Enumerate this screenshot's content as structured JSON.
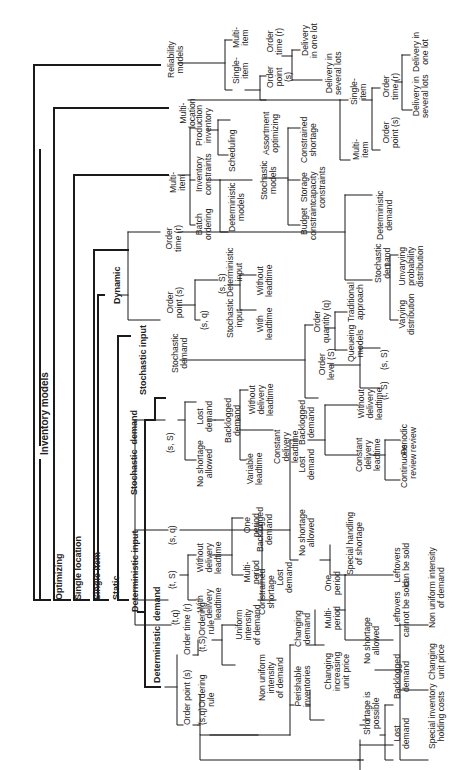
{
  "diagram": {
    "title": "Inventory models",
    "nodes": [
      {
        "id": "root",
        "text": "Inventory models",
        "x": 40,
        "y": 455,
        "cls": "root"
      },
      {
        "id": "optimizing",
        "text": "Optimizing",
        "x": 55,
        "y": 600,
        "cls": "bold"
      },
      {
        "id": "single_location",
        "text": "Single location",
        "x": 74,
        "y": 600,
        "cls": "bold"
      },
      {
        "id": "single_item",
        "text": "Single item",
        "x": 93,
        "y": 600,
        "cls": "bold"
      },
      {
        "id": "static",
        "text": "Static",
        "x": 112,
        "y": 600,
        "cls": "bold"
      },
      {
        "id": "deterministic_input",
        "text": "Deterministic input",
        "x": 131,
        "y": 612,
        "cls": "bold"
      },
      {
        "id": "reliability",
        "text": "Reliability\nmodels",
        "x": 167,
        "y": 78
      },
      {
        "id": "multi_location",
        "text": "Multi-\nlocation",
        "x": 179,
        "y": 128
      },
      {
        "id": "multi_item",
        "text": "Multi-\nitem",
        "x": 169,
        "y": 193
      },
      {
        "id": "dynamic",
        "text": "Dynamic",
        "x": 113,
        "y": 304,
        "cls": "bold"
      },
      {
        "id": "stochastic_input",
        "text": "Stochastic input",
        "x": 139,
        "y": 395,
        "cls": "bold"
      },
      {
        "id": "stochastic_demand_top",
        "text": "Stochastic\ndemand",
        "x": 171,
        "y": 373
      },
      {
        "id": "stochastic_demand",
        "text": "Stochastic  demand",
        "x": 130,
        "y": 495,
        "cls": "bold"
      },
      {
        "id": "deterministic_demand",
        "text": "Deterministic  demand",
        "x": 153,
        "y": 683,
        "cls": "bold"
      },
      {
        "id": "order_time_r_dyn",
        "text": "Order\ntime (r)",
        "x": 165,
        "y": 252
      },
      {
        "id": "order_point_s_dyn",
        "text": "Order\npoint (s)",
        "x": 166,
        "y": 318
      },
      {
        "id": "sq_dyn",
        "text": "(s, q)",
        "x": 200,
        "y": 330
      },
      {
        "id": "sS_dyn",
        "text": "(s, S)",
        "x": 218,
        "y": 294
      },
      {
        "id": "stoch_input_dyn",
        "text": "Stochastic\ninput",
        "x": 226,
        "y": 338
      },
      {
        "id": "det_input_dyn",
        "text": "Deterministic\ninput",
        "x": 226,
        "y": 297
      },
      {
        "id": "with_lt",
        "text": "With\nleadtime",
        "x": 256,
        "y": 340
      },
      {
        "id": "without_lt",
        "text": "Without\nleadtime",
        "x": 256,
        "y": 297
      },
      {
        "id": "batch",
        "text": "Batch\nordering",
        "x": 195,
        "y": 240
      },
      {
        "id": "inv_constraints",
        "text": "Inventory\nconstraints",
        "x": 195,
        "y": 195
      },
      {
        "id": "production_inv",
        "text": "Production\ninventory",
        "x": 195,
        "y": 146
      },
      {
        "id": "det_models",
        "text": "Deterministic\nmodels",
        "x": 228,
        "y": 232
      },
      {
        "id": "stoch_models",
        "text": "Stochastic\nmodels",
        "x": 260,
        "y": 200
      },
      {
        "id": "scheduling",
        "text": "Scheduling",
        "x": 228,
        "y": 172
      },
      {
        "id": "assortment",
        "text": "Assortment\noptimizing",
        "x": 262,
        "y": 155
      },
      {
        "id": "budget",
        "text": "Budget\nconstraint",
        "x": 300,
        "y": 240
      },
      {
        "id": "storage",
        "text": "Storage\ncapacity\nconstraints",
        "x": 300,
        "y": 208
      },
      {
        "id": "constrained_shortage_top",
        "text": "Constrained\nshortage",
        "x": 300,
        "y": 163
      },
      {
        "id": "single_item_rel",
        "text": "Single-\nitem",
        "x": 232,
        "y": 84
      },
      {
        "id": "multi_item_rel",
        "text": "Multi-\nitem",
        "x": 232,
        "y": 48
      },
      {
        "id": "order_point_rel",
        "text": "Order\npoint\n(s)",
        "x": 266,
        "y": 88
      },
      {
        "id": "order_time_rel",
        "text": "Order\ntime (r)",
        "x": 266,
        "y": 55
      },
      {
        "id": "delivery_one_rel",
        "text": "Delivery\nin one lot",
        "x": 301,
        "y": 58
      },
      {
        "id": "delivery_several_rel",
        "text": "Delivery in\nseveral lots",
        "x": 325,
        "y": 95
      },
      {
        "id": "single_item_ml",
        "text": "Single-\nitem",
        "x": 350,
        "y": 105
      },
      {
        "id": "multi_item_ml",
        "text": "Multi-\nitem",
        "x": 352,
        "y": 160
      },
      {
        "id": "order_time_ml",
        "text": "Order\ntime (r)",
        "x": 382,
        "y": 100
      },
      {
        "id": "order_point_ml",
        "text": "Order\npoint (s)",
        "x": 382,
        "y": 148
      },
      {
        "id": "delivery_one_ml",
        "text": "Delivery in\none lot",
        "x": 412,
        "y": 72
      },
      {
        "id": "delivery_several_ml",
        "text": "Delivery in\nseveral lots",
        "x": 412,
        "y": 118
      },
      {
        "id": "det_demand_dyn",
        "text": "Deterministic\ndemand",
        "x": 376,
        "y": 240
      },
      {
        "id": "stoch_demand_dyn",
        "text": "Stochastic\ndemand",
        "x": 374,
        "y": 283
      },
      {
        "id": "unvarying",
        "text": "Unvarying\nprobability\ndistribution",
        "x": 398,
        "y": 287
      },
      {
        "id": "varying",
        "text": "Varying\ndistribution",
        "x": 398,
        "y": 335
      },
      {
        "id": "order_quantity",
        "text": "Order\nquantity (q)",
        "x": 313,
        "y": 343
      },
      {
        "id": "traditional",
        "text": "Traditional\napproach",
        "x": 347,
        "y": 322
      },
      {
        "id": "queueing",
        "text": "Queueing\nmodels",
        "x": 347,
        "y": 362
      },
      {
        "id": "order_level",
        "text": "Order\nlevel (S)",
        "x": 318,
        "y": 380
      },
      {
        "id": "sS_ol",
        "text": "(s, S)",
        "x": 380,
        "y": 370
      },
      {
        "id": "tS_ol",
        "text": "(t, S)",
        "x": 380,
        "y": 400
      },
      {
        "id": "sq_sd",
        "text": "(s, q)",
        "x": 168,
        "y": 545
      },
      {
        "id": "sS_sd",
        "text": "(s, S)",
        "x": 166,
        "y": 453
      },
      {
        "id": "tS_sd",
        "text": "(t, S)",
        "x": 168,
        "y": 589
      },
      {
        "id": "tq_sd",
        "text": "(t,q)",
        "x": 171,
        "y": 625
      },
      {
        "id": "no_shortage_sS",
        "text": "No shortage\nallowed",
        "x": 196,
        "y": 487
      },
      {
        "id": "lost_demand_sS",
        "text": "Lost\ndemand",
        "x": 196,
        "y": 432
      },
      {
        "id": "backlogged_sS",
        "text": "Backlogged\ndemand",
        "x": 224,
        "y": 443
      },
      {
        "id": "variable_lt",
        "text": "Variable\nleadtime",
        "x": 246,
        "y": 485
      },
      {
        "id": "constant_dlt",
        "text": "Constant\ndelivery\nleadtime",
        "x": 273,
        "y": 464
      },
      {
        "id": "without_dlt_sS",
        "text": "Without\ndelivery\nleadtime",
        "x": 248,
        "y": 416
      },
      {
        "id": "with_dlt",
        "text": "With\ndelivery\nleadtime",
        "x": 196,
        "y": 620
      },
      {
        "id": "without_dlt",
        "text": "Without\ndelivery\nleadtime",
        "x": 196,
        "y": 574
      },
      {
        "id": "one_period_ts",
        "text": "One\nperiod",
        "x": 243,
        "y": 537
      },
      {
        "id": "multi_period_ts",
        "text": "Multi-\nperiod",
        "x": 243,
        "y": 584
      },
      {
        "id": "backlogged_ts",
        "text": "Backlogged\ndemand",
        "x": 256,
        "y": 552
      },
      {
        "id": "lost_demand_ts",
        "text": "Lost\ndemand",
        "x": 276,
        "y": 593
      },
      {
        "id": "constrained_shortage",
        "text": "Constrained\nshortage",
        "x": 258,
        "y": 615
      },
      {
        "id": "no_shortage_sq",
        "text": "No shortage\nallowed",
        "x": 298,
        "y": 556
      },
      {
        "id": "lost_demand_sq",
        "text": "Lost\ndemand",
        "x": 298,
        "y": 480
      },
      {
        "id": "backlogged_sq",
        "text": "Backlogged\ndemand",
        "x": 298,
        "y": 445
      },
      {
        "id": "special_handling",
        "text": "Special handling\nof shortage",
        "x": 346,
        "y": 575
      },
      {
        "id": "without_dlt_sq",
        "text": "Without\ndelivery\nleadtime",
        "x": 357,
        "y": 420
      },
      {
        "id": "constant_dlt_sq",
        "text": "Constant\ndelivery\nleadtime",
        "x": 355,
        "y": 472
      },
      {
        "id": "continuous_review",
        "text": "Continuous\nreview",
        "x": 400,
        "y": 488
      },
      {
        "id": "periodic_review",
        "text": "Periodic\nreview",
        "x": 400,
        "y": 455
      },
      {
        "id": "order_point_dd",
        "text": "Order point (s)",
        "x": 183,
        "y": 725
      },
      {
        "id": "order_time_dd",
        "text": "Order time (r)",
        "x": 183,
        "y": 655
      },
      {
        "id": "sq_rule",
        "text": "(s,q)Ordering\nrule",
        "x": 198,
        "y": 725
      },
      {
        "id": "tS_rule",
        "text": "(t,S)Ordering\nrule",
        "x": 198,
        "y": 652
      },
      {
        "id": "uniform",
        "text": "Uniform\nintensity\nof demand",
        "x": 235,
        "y": 645
      },
      {
        "id": "non_uniform",
        "text": "Non uniform\nintensity\nof demand",
        "x": 258,
        "y": 701
      },
      {
        "id": "perishable",
        "text": "Perishable\ninventories",
        "x": 294,
        "y": 707
      },
      {
        "id": "changing_demand",
        "text": "Changing\ndemand",
        "x": 294,
        "y": 647
      },
      {
        "id": "changing_increasing",
        "text": "Changing\nincreasing\nunit price",
        "x": 324,
        "y": 691
      },
      {
        "id": "one_period_dd",
        "text": "One\nperiod",
        "x": 324,
        "y": 595
      },
      {
        "id": "multi_period_dd",
        "text": "Multi-\nperiod",
        "x": 324,
        "y": 630
      },
      {
        "id": "leftovers_sold",
        "text": "Leftovers\ncan be sold",
        "x": 393,
        "y": 587
      },
      {
        "id": "leftovers_not_sold",
        "text": "Leftovers\ncannot be sold",
        "x": 393,
        "y": 637
      },
      {
        "id": "no_shortage_dd",
        "text": "No shortage\nallowed",
        "x": 363,
        "y": 664
      },
      {
        "id": "shortage_possible",
        "text": "Shortage is\npossible",
        "x": 363,
        "y": 735
      },
      {
        "id": "backlogged_dd",
        "text": "Backlogged\ndemand",
        "x": 393,
        "y": 699
      },
      {
        "id": "lost_demand_dd",
        "text": "Lost\ndemand",
        "x": 393,
        "y": 749
      },
      {
        "id": "special_holding",
        "text": "Special inventory\nholding costs",
        "x": 428,
        "y": 749
      },
      {
        "id": "changing_unit_price",
        "text": "Changing\nunit price",
        "x": 428,
        "y": 680
      },
      {
        "id": "non_uniform_intensity",
        "text": "Non uniform intensity\nof demand",
        "x": 428,
        "y": 628
      }
    ]
  }
}
